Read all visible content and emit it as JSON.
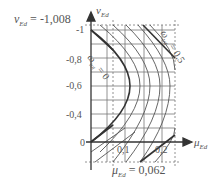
{
  "diagram": {
    "y_axis": {
      "symbol": "v",
      "subscript": "Ed",
      "ticks": [
        "-1",
        "-0,8",
        "-0,6",
        "-0,4",
        "0"
      ]
    },
    "x_axis": {
      "symbol": "μ",
      "subscript": "Ed",
      "ticks": [
        "0,1",
        "0,2"
      ]
    },
    "annotations": {
      "v_value": {
        "symbol": "v",
        "subscript": "Ed",
        "text": "= -1,008"
      },
      "mu_value": {
        "symbol": "μ",
        "subscript": "Ed",
        "text": "= 0,062"
      },
      "curve_zero": {
        "symbol": "ω",
        "subscript": "tot",
        "text": "= 0"
      },
      "curve_half": {
        "symbol": "ω",
        "subscript": "tot",
        "text": "= 0,5"
      }
    }
  }
}
